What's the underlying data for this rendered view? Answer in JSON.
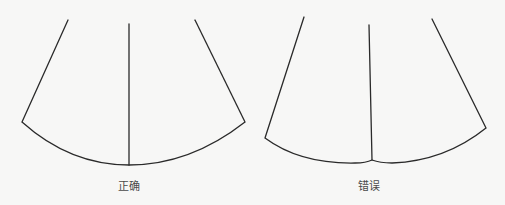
{
  "diagrams": [
    {
      "id": "correct",
      "caption": "正确",
      "caption_pos": {
        "x": 129,
        "y": 177
      },
      "stroke": "#2a2a2a",
      "left_edge": {
        "x1": 68,
        "y1": 20,
        "x2": 22,
        "y2": 122
      },
      "right_edge": {
        "x1": 195,
        "y1": 20,
        "x2": 245,
        "y2": 122
      },
      "center_line": {
        "x1": 129,
        "y1": 24,
        "x2": 129,
        "y2": 165
      },
      "hem_curve": "M22,122 Q70,165 129,165 Q190,165 245,122"
    },
    {
      "id": "wrong",
      "caption": "错误",
      "caption_pos": {
        "x": 369,
        "y": 177
      },
      "stroke": "#2a2a2a",
      "left_edge": {
        "x1": 304,
        "y1": 17,
        "x2": 265,
        "y2": 138
      },
      "right_edge": {
        "x1": 432,
        "y1": 19,
        "x2": 486,
        "y2": 128
      },
      "center_line": {
        "x1": 369,
        "y1": 25,
        "x2": 372,
        "y2": 160
      },
      "hem_curve": "M265,138 Q300,164 355,163 Q366,163 372,160 Q380,163 392,163 Q445,161 486,128"
    }
  ]
}
